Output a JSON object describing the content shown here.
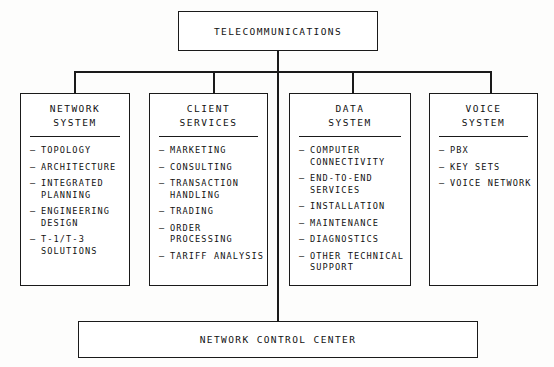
{
  "diagram": {
    "title": "TELECOMMUNICATIONS",
    "footer": "NETWORK CONTROL CENTER",
    "departments": [
      {
        "title_line1": "NETWORK",
        "title_line2": "SYSTEM",
        "items": [
          {
            "line1": "TOPOLOGY",
            "line2": ""
          },
          {
            "line1": "ARCHITECTURE",
            "line2": ""
          },
          {
            "line1": "INTEGRATED",
            "line2": "PLANNING"
          },
          {
            "line1": "ENGINEERING",
            "line2": "DESIGN"
          },
          {
            "line1": "T-1/T-3",
            "line2": "SOLUTIONS"
          }
        ]
      },
      {
        "title_line1": "CLIENT",
        "title_line2": "SERVICES",
        "items": [
          {
            "line1": "MARKETING",
            "line2": ""
          },
          {
            "line1": "CONSULTING",
            "line2": ""
          },
          {
            "line1": "TRANSACTION",
            "line2": "HANDLING"
          },
          {
            "line1": "TRADING",
            "line2": ""
          },
          {
            "line1": "ORDER",
            "line2": "PROCESSING"
          },
          {
            "line1": "TARIFF ANALYSIS",
            "line2": ""
          }
        ]
      },
      {
        "title_line1": "DATA",
        "title_line2": "SYSTEM",
        "items": [
          {
            "line1": "COMPUTER",
            "line2": "CONNECTIVITY"
          },
          {
            "line1": "END-TO-END",
            "line2": "SERVICES"
          },
          {
            "line1": "INSTALLATION",
            "line2": ""
          },
          {
            "line1": "MAINTENANCE",
            "line2": ""
          },
          {
            "line1": "DIAGNOSTICS",
            "line2": ""
          },
          {
            "line1": "OTHER TECHNICAL",
            "line2": "SUPPORT"
          }
        ]
      },
      {
        "title_line1": "VOICE",
        "title_line2": "SYSTEM",
        "items": [
          {
            "line1": "PBX",
            "line2": ""
          },
          {
            "line1": "KEY SETS",
            "line2": ""
          },
          {
            "line1": "VOICE NETWORK",
            "line2": ""
          }
        ]
      }
    ],
    "bullet_dash": "–",
    "colors": {
      "line": "#1a1a1a",
      "background": "#fdfdfc",
      "box_fill": "#ffffff"
    }
  }
}
